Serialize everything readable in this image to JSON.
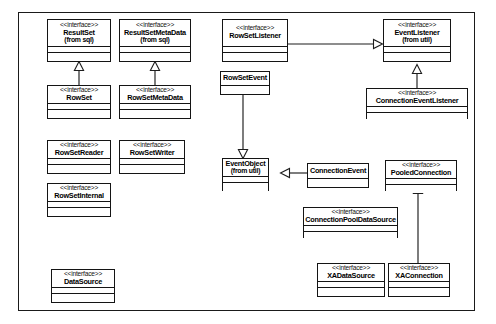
{
  "diagram": {
    "kind": "uml-class-diagram",
    "title": "",
    "frame_border_color": "#1a1a1a",
    "background_color": "#ffffff",
    "line_color": "#1d1d1d",
    "stereotype_label": "<<interface>>",
    "nodes": [
      {
        "id": "resultset",
        "stereotype": "<<interface>>",
        "name": "ResultSet",
        "package": "(from sql)"
      },
      {
        "id": "resultsetmetadata",
        "stereotype": "<<interface>>",
        "name": "ResultSetMetaData",
        "package": "(from sql)"
      },
      {
        "id": "rowsetlistener",
        "stereotype": "<<interface>>",
        "name": "RowSetListener",
        "package": ""
      },
      {
        "id": "eventlistener",
        "stereotype": "<<interface>>",
        "name": "EventListener",
        "package": "(from util)"
      },
      {
        "id": "rowset",
        "stereotype": "<<interface>>",
        "name": "RowSet",
        "package": ""
      },
      {
        "id": "rowsetmetadata",
        "stereotype": "<<interface>>",
        "name": "RowSetMetaData",
        "package": ""
      },
      {
        "id": "rowsetevent",
        "stereotype": "",
        "name": "RowSetEvent",
        "package": ""
      },
      {
        "id": "connectioneventlistener",
        "stereotype": "<<interface>>",
        "name": "ConnectionEventListener",
        "package": ""
      },
      {
        "id": "rowsetreader",
        "stereotype": "<<interface>>",
        "name": "RowSetReader",
        "package": ""
      },
      {
        "id": "rowsetwriter",
        "stereotype": "<<interface>>",
        "name": "RowSetWriter",
        "package": ""
      },
      {
        "id": "rowsetinternal",
        "stereotype": "<<interface>>",
        "name": "RowSetInternal",
        "package": ""
      },
      {
        "id": "eventobject",
        "stereotype": "",
        "name": "EventObject",
        "package": "(from util)"
      },
      {
        "id": "connectionevent",
        "stereotype": "",
        "name": "ConnectionEvent",
        "package": ""
      },
      {
        "id": "pooledconnection",
        "stereotype": "<<interface>>",
        "name": "PooledConnection",
        "package": ""
      },
      {
        "id": "connectionpooldatasource",
        "stereotype": "<<interface>>",
        "name": "ConnectionPoolDataSource",
        "package": ""
      },
      {
        "id": "datasource",
        "stereotype": "<<interface>>",
        "name": "DataSource",
        "package": ""
      },
      {
        "id": "xadatasource",
        "stereotype": "<<interface>>",
        "name": "XADataSource",
        "package": ""
      },
      {
        "id": "xaconnection",
        "stereotype": "<<interface>>",
        "name": "XAConnection",
        "package": ""
      }
    ],
    "relationships": [
      {
        "from": "rowset",
        "to": "resultset",
        "type": "generalization"
      },
      {
        "from": "rowsetmetadata",
        "to": "resultsetmetadata",
        "type": "generalization"
      },
      {
        "from": "rowsetlistener",
        "to": "eventlistener",
        "type": "generalization"
      },
      {
        "from": "connectioneventlistener",
        "to": "eventlistener",
        "type": "generalization"
      },
      {
        "from": "rowsetevent",
        "to": "eventobject",
        "type": "generalization"
      },
      {
        "from": "connectionevent",
        "to": "eventobject",
        "type": "generalization"
      },
      {
        "from": "xaconnection",
        "to": "pooledconnection",
        "type": "generalization"
      }
    ]
  }
}
